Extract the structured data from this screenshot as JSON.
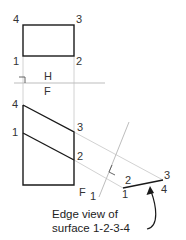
{
  "diagram": {
    "type": "auxiliary-view-construction",
    "colors": {
      "object_line": "#1a1a1a",
      "projection_line": "#cfcfcf",
      "fold_line": "#bdbdbd",
      "text": "#333333"
    },
    "top_view": {
      "labels": {
        "p4": "4",
        "p3": "3",
        "p1": "1",
        "p2": "2"
      }
    },
    "fold_line_hf": {
      "upper_label": "H",
      "lower_label": "F"
    },
    "front_view": {
      "labels": {
        "p4": "4",
        "p1": "1",
        "p3": "3",
        "p2": "2"
      }
    },
    "fold_line_f1": {
      "label_left": "F",
      "label_right": "1"
    },
    "auxiliary_view": {
      "labels": {
        "p2": "2",
        "p1": "1",
        "p3": "3",
        "p4": "4"
      }
    },
    "caption": {
      "line1": "Edge view of",
      "line2": "surface 1-2-3-4"
    }
  }
}
